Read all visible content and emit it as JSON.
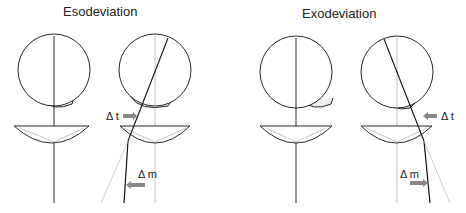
{
  "panels": [
    {
      "title": "Esodeviation",
      "labels": {
        "delta_t": "Δ t",
        "delta_m": "Δ m"
      }
    },
    {
      "title": "Exodeviation",
      "labels": {
        "delta_t": "Δ t",
        "delta_m": "Δ m"
      }
    }
  ],
  "colors": {
    "stroke": "#111111",
    "faint": "#aaaaaa",
    "arrow_fill": "#888888"
  }
}
